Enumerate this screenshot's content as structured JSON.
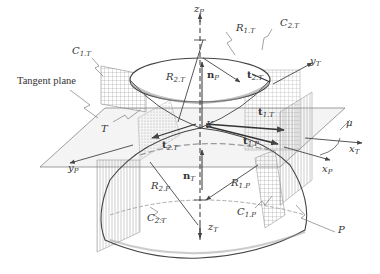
{
  "figure": {
    "labels": {
      "tangent_plane": "Tangent plane",
      "c1t": {
        "base": "C",
        "sub": "1.T"
      },
      "c2t_top": {
        "base": "C",
        "sub": "2.T"
      },
      "c2t_bottom": {
        "base": "C",
        "sub": "2.T"
      },
      "c1p": {
        "base": "C",
        "sub": "1.P"
      },
      "r1t": {
        "base": "R",
        "sub": "1.T"
      },
      "r2t": {
        "base": "R",
        "sub": "2.T"
      },
      "r1p": {
        "base": "R",
        "sub": "1.P"
      },
      "r2p": {
        "base": "R",
        "sub": "2.P"
      },
      "zp": {
        "base": "z",
        "sub": "P"
      },
      "zt": {
        "base": "z",
        "sub": "T"
      },
      "yt": {
        "base": "y",
        "sub": "T"
      },
      "yp": {
        "base": "y",
        "sub": "P"
      },
      "xt": {
        "base": "x",
        "sub": "T"
      },
      "xp": {
        "base": "x",
        "sub": "P"
      },
      "np": {
        "base": "n",
        "sub": "P"
      },
      "nt": {
        "base": "n",
        "sub": "T"
      },
      "t2t_top": {
        "base": "t",
        "sub": "2.T"
      },
      "t2t_left": {
        "base": "t",
        "sub": "2.T"
      },
      "t1t": {
        "base": "t",
        "sub": "1.T"
      },
      "t1p": {
        "base": "t",
        "sub": "1.P"
      },
      "k": "K",
      "t": "T",
      "p": "P",
      "mu": "μ"
    },
    "colors": {
      "line": "#555555",
      "dark_line": "#333333",
      "hatch": "#888888",
      "shade": "#dddddd"
    }
  }
}
